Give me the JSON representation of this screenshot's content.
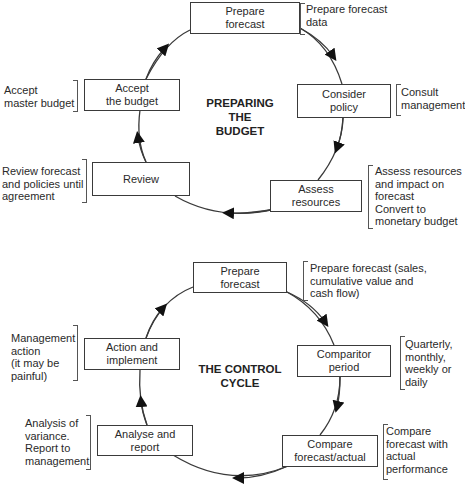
{
  "cycles": [
    {
      "title": "PREPARING\nTHE\nBUDGET",
      "steps": [
        {
          "label": "Prepare\nforecast",
          "note": "Prepare forecast\ndata"
        },
        {
          "label": "Consider\npolicy",
          "note": "Consult\nmanagement"
        },
        {
          "label": "Assess\nresources",
          "note": "Assess resources\nand impact on\nforecast\nConvert to\nmonetary budget"
        },
        {
          "label": "Review",
          "note": "Review forecast\nand policies until\nagreement"
        },
        {
          "label": "Accept\nthe budget",
          "note": "Accept\nmaster budget"
        }
      ]
    },
    {
      "title": "THE CONTROL\nCYCLE",
      "steps": [
        {
          "label": "Prepare\nforecast",
          "note": "Prepare forecast (sales,\ncumulative value and\ncash flow)"
        },
        {
          "label": "Comparitor\nperiod",
          "note": "Quarterly,\nmonthly,\nweekly or\ndaily"
        },
        {
          "label": "Compare\nforecast/actual",
          "note": "Compare\nforecast with\nactual\nperformance"
        },
        {
          "label": "Analyse and\nreport",
          "note": "Analysis of\nvariance.\nReport to\nmanagement"
        },
        {
          "label": "Action and\nimplement",
          "note": "Management\naction\n(it may be\npainful)"
        }
      ]
    }
  ],
  "colors": {
    "line": "#3a3a3a",
    "text": "#2a2a2a",
    "background": "#ffffff"
  }
}
